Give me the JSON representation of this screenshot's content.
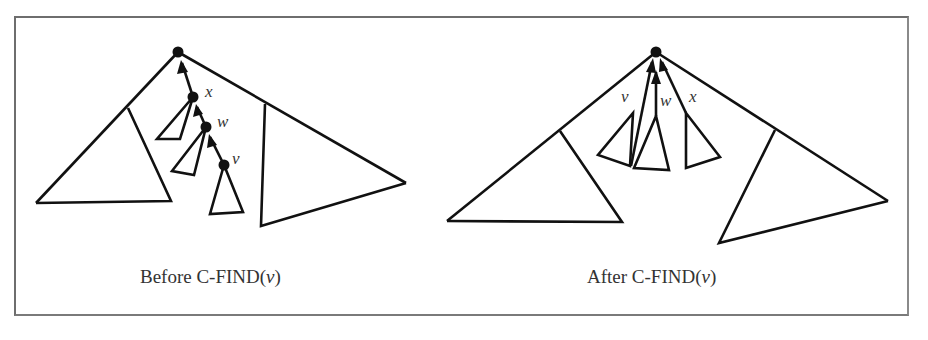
{
  "figure": {
    "left_panel": {
      "caption_prefix": "Before C-FIND(",
      "caption_arg": "v",
      "caption_suffix": ")",
      "node_labels": {
        "x": "x",
        "w": "w",
        "v": "v"
      }
    },
    "right_panel": {
      "caption_prefix": "After C-FIND(",
      "caption_arg": "v",
      "caption_suffix": ")",
      "node_labels": {
        "v": "v",
        "w": "w",
        "x": "x"
      }
    },
    "colors": {
      "stroke": "#111111",
      "text": "#333333",
      "frame": "#6e6e6e",
      "background": "#ffffff"
    }
  }
}
